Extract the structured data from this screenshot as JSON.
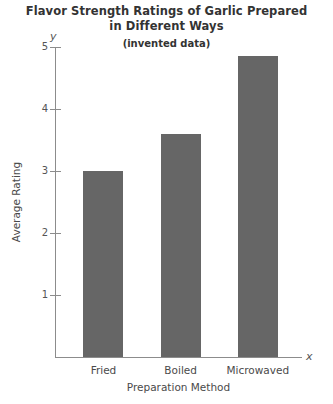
{
  "chart_data": {
    "type": "bar",
    "title": "Flavor Strength Ratings of Garlic Prepared in Different Ways",
    "title_lines": [
      "Flavor Strength Ratings of Garlic Prepared",
      "in Different Ways"
    ],
    "subtitle": "(invented data)",
    "categories": [
      "Fried",
      "Boiled",
      "Microwaved"
    ],
    "values": [
      3.0,
      3.6,
      4.85
    ],
    "xlabel": "Preparation Method",
    "ylabel": "Average Rating",
    "x_axis_name": "x",
    "y_axis_name": "y",
    "ylim": [
      0,
      5.4
    ],
    "yticks": [
      5,
      4,
      3,
      2,
      1
    ],
    "ytick_labels": [
      "5",
      "4",
      "3",
      "2",
      "1"
    ],
    "grid": false,
    "legend": null,
    "bar_color": "#666666",
    "axis_color": "#8c8c8c",
    "text_color": "#4a4a4a"
  }
}
